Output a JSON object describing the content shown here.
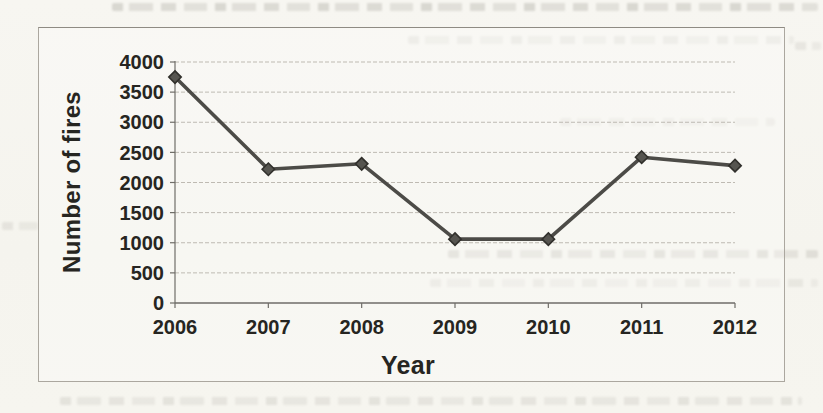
{
  "page": {
    "paper_color": "#f6f5f0",
    "ink_color": "#262521"
  },
  "chart_data": {
    "type": "line",
    "title": "",
    "categories": [
      "2006",
      "2007",
      "2008",
      "2009",
      "2010",
      "2011",
      "2012"
    ],
    "values": [
      3750,
      2220,
      2310,
      1060,
      1060,
      2420,
      2280
    ],
    "xlabel": "Year",
    "ylabel": "Number of fires",
    "ylim": [
      0,
      4000
    ],
    "yticks": [
      0,
      500,
      1000,
      1500,
      2000,
      2500,
      3000,
      3500,
      4000
    ],
    "grid": true,
    "legend": "none",
    "marker": "diamond",
    "line_color": "#4c4b47",
    "marker_fill": "#565550",
    "marker_stroke": "#31302c",
    "gridline_color": "#b8b4ac",
    "axis_color": "#6f6d68",
    "label_color": "#262521"
  }
}
